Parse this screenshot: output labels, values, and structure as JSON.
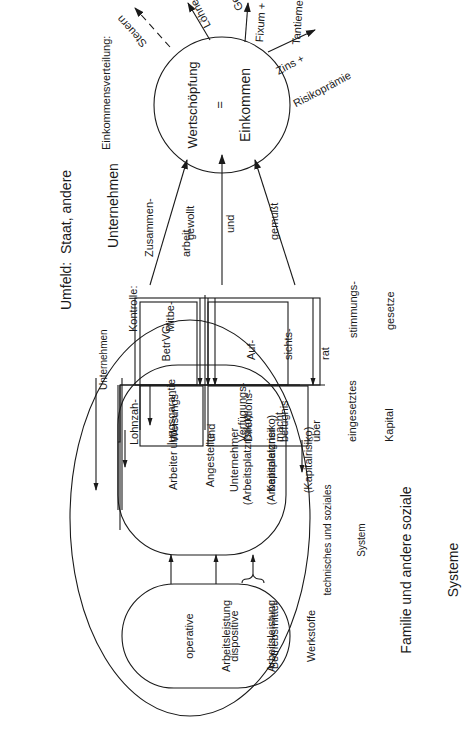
{
  "environment": {
    "title_line1": "Umfeld:  Staat, andere",
    "title_line2": "Unternehmen"
  },
  "family": {
    "line1": "Familie und andere soziale",
    "line2": "Systeme"
  },
  "enterprise": {
    "label": "Unternehmen",
    "system_label_line1": "technisches und soziales",
    "system_label_line2": "System",
    "inputs": [
      {
        "line1": "operative",
        "line2": "Arbeitsleistung"
      },
      {
        "line1": "dispositive",
        "line2": "Arbeitsleistung"
      },
      {
        "line1": "Betriebsmittel",
        "line2": "Werkstoffe"
      }
    ],
    "actors": [
      {
        "line1": "Arbeiter und",
        "line2": "Angestellte",
        "line3": "(Arbeitsplatzrisiko)"
      },
      {
        "line1": "Unternehmer",
        "line2": "(Arbeitsplatzrisiko)"
      },
      {
        "line1": "Kapitaleigner",
        "line2": "(Kapitalrisiko)"
      }
    ]
  },
  "rights": {
    "wage_guarantee_line1": "Lohnzah-",
    "wage_guarantee_line2": "lungsgarantie",
    "directive": [
      "Weisungs-",
      "und",
      "Direktions-",
      "befugnis"
    ],
    "disposal": [
      "Verfügungs-",
      "macht",
      "über",
      "eingesetztes",
      "Kapital"
    ]
  },
  "control": {
    "label_line1": "Kontrolle:",
    "label_line2": "Mitbe-",
    "label_line3": "stimmungs-",
    "label_line4": "gesetze",
    "betrvg": "BetrVG",
    "board": [
      "Auf-",
      "sichts-",
      "rat"
    ]
  },
  "cooperation": {
    "label_line1": "Zusammen-",
    "label_line2": "arbeit",
    "wanted": "gewollt",
    "and": "und",
    "forced": "gemußt"
  },
  "value_creation": {
    "top": "Wertschöpfung",
    "equals": "=",
    "bottom": "Einkommen"
  },
  "distribution": {
    "title": "Einkommensverteilung:",
    "outputs": [
      {
        "line1": "Steuern",
        "line2": "",
        "style": "dashed"
      },
      {
        "line1": "Löhne +",
        "line2": "Gehälter",
        "style": "solid"
      },
      {
        "line1": "Fixum +",
        "line2": "Tantieme",
        "style": "solid"
      },
      {
        "line1": "Zins +",
        "line2": "Risikoprämie",
        "style": "solid"
      }
    ]
  }
}
